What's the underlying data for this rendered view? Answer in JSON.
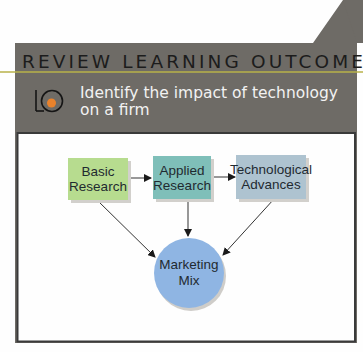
{
  "header": {
    "title": "REVIEW LEARNING OUTCOME",
    "lo_badge": {
      "letters": "LO",
      "number": "6",
      "icon": "learning-outcome-badge-icon"
    },
    "objective": "Identify the impact of technology on a firm"
  },
  "diagram": {
    "nodes": [
      {
        "id": "basic",
        "label": [
          "Basic",
          "Research"
        ],
        "shape": "rectangle",
        "color": "#b7dc8f"
      },
      {
        "id": "applied",
        "label": [
          "Applied",
          "Research"
        ],
        "shape": "rectangle",
        "color": "#7fbfb9"
      },
      {
        "id": "tech",
        "label": [
          "Technological",
          "Advances"
        ],
        "shape": "rectangle",
        "color": "#aec3d0"
      },
      {
        "id": "mix",
        "label": [
          "Marketing",
          "Mix"
        ],
        "shape": "circle",
        "color": "#8fb5e3"
      }
    ],
    "edges": [
      {
        "from": "basic",
        "to": "applied"
      },
      {
        "from": "applied",
        "to": "tech"
      },
      {
        "from": "basic",
        "to": "mix"
      },
      {
        "from": "applied",
        "to": "mix"
      },
      {
        "from": "tech",
        "to": "mix"
      }
    ]
  },
  "colors": {
    "panel": "#6e6b66",
    "accent_line": "#b9b24a",
    "lo_number": "#e9822c",
    "frame_border": "#3a3a3a"
  }
}
